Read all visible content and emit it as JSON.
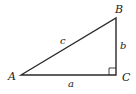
{
  "diagram": {
    "type": "right-triangle",
    "colors": {
      "stroke": "#2a2a2a",
      "text": "#222222",
      "background": "#ffffff"
    },
    "vertices": {
      "A": {
        "label": "A",
        "x": 21,
        "y": 75
      },
      "B": {
        "label": "B",
        "x": 116,
        "y": 18
      },
      "C": {
        "label": "C",
        "x": 116,
        "y": 75
      }
    },
    "sides": {
      "a": {
        "label": "a",
        "between": "A-C"
      },
      "b": {
        "label": "b",
        "between": "B-C"
      },
      "c": {
        "label": "c",
        "between": "A-B"
      }
    },
    "right_angle_at": "C"
  }
}
